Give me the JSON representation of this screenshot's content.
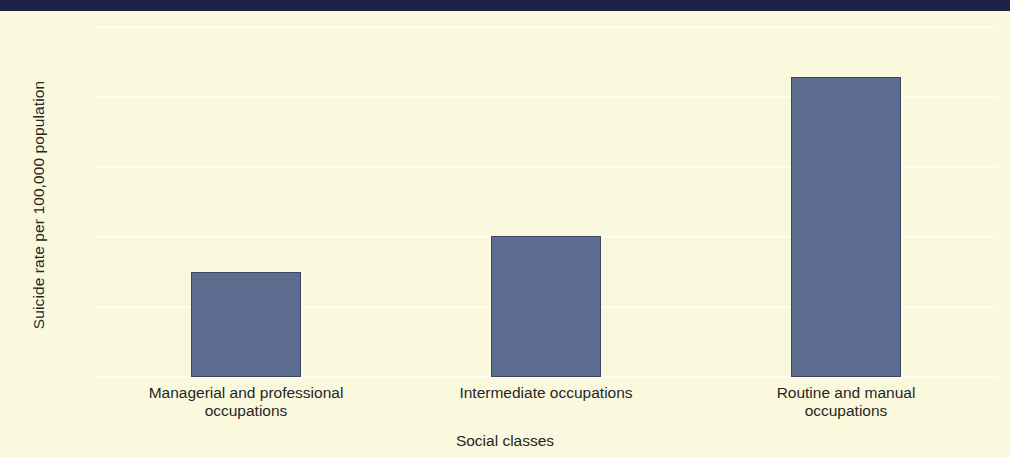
{
  "chart_data": {
    "type": "bar",
    "title": "",
    "subtitle": "",
    "xlabel": "Social classes",
    "ylabel": "Suicide rate per 100,000 population",
    "categories": [
      "Managerial and professional occupations",
      "Intermediate occupations",
      "Routine and manual occupations"
    ],
    "category_lines": [
      [
        "Managerial and professional",
        "occupations"
      ],
      [
        "Intermediate occupations"
      ],
      [
        "Routine and manual",
        "occupations"
      ]
    ],
    "values": [
      7.5,
      10.1,
      21.4
    ],
    "ylim": [
      0,
      25
    ],
    "yticks": [
      0,
      5,
      10,
      15,
      20,
      25
    ],
    "ytick_labels": [
      "0",
      "5",
      "10",
      "15",
      "20",
      "25"
    ],
    "grid": true,
    "grid_axis": "y",
    "legend": null,
    "series": [
      {
        "name": "Suicide rate",
        "values": [
          7.5,
          10.1,
          21.4
        ]
      }
    ],
    "colors": {
      "bar_fill": "#5b6c8e",
      "bar_edge": "#3b4763",
      "background": "#fbf9dd",
      "gridline": "#fffdf0",
      "text": "#262626",
      "top_band": "#1b2244"
    }
  }
}
